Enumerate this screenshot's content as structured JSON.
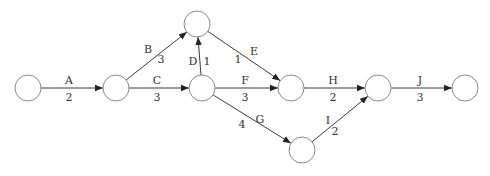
{
  "diagram": {
    "type": "activity-on-arrow network",
    "nodes": [
      {
        "id": "n1",
        "cx": 28,
        "cy": 88,
        "r": 13
      },
      {
        "id": "n2",
        "cx": 116,
        "cy": 88,
        "r": 13
      },
      {
        "id": "n3",
        "cx": 197,
        "cy": 24,
        "r": 13
      },
      {
        "id": "n4",
        "cx": 202,
        "cy": 88,
        "r": 13
      },
      {
        "id": "n5",
        "cx": 291,
        "cy": 88,
        "r": 13
      },
      {
        "id": "n6",
        "cx": 302,
        "cy": 150,
        "r": 13
      },
      {
        "id": "n7",
        "cx": 378,
        "cy": 88,
        "r": 13
      },
      {
        "id": "n8",
        "cx": 465,
        "cy": 88,
        "r": 13
      }
    ],
    "edges": [
      {
        "name": "A",
        "duration": "2",
        "from": "n1",
        "to": "n2",
        "name_pos": [
          69,
          84
        ],
        "dur_pos": [
          69,
          101
        ]
      },
      {
        "name": "B",
        "duration": "3",
        "from": "n2",
        "to": "n3",
        "name_pos": [
          148,
          53
        ],
        "dur_pos": [
          161,
          63
        ]
      },
      {
        "name": "C",
        "duration": "3",
        "from": "n2",
        "to": "n4",
        "name_pos": [
          157,
          84
        ],
        "dur_pos": [
          157,
          101
        ]
      },
      {
        "name": "D",
        "duration": "1",
        "from": "n4",
        "to": "n3",
        "name_pos": [
          193,
          65
        ],
        "dur_pos": [
          207,
          65
        ]
      },
      {
        "name": "E",
        "duration": "1",
        "from": "n3",
        "to": "n5",
        "name_pos": [
          254,
          55
        ],
        "dur_pos": [
          238,
          63
        ]
      },
      {
        "name": "F",
        "duration": "3",
        "from": "n4",
        "to": "n5",
        "name_pos": [
          245,
          84
        ],
        "dur_pos": [
          245,
          101
        ]
      },
      {
        "name": "G",
        "duration": "4",
        "from": "n4",
        "to": "n6",
        "name_pos": [
          260,
          123
        ],
        "dur_pos": [
          242,
          128
        ]
      },
      {
        "name": "H",
        "duration": "2",
        "from": "n5",
        "to": "n7",
        "name_pos": [
          333,
          84
        ],
        "dur_pos": [
          333,
          101
        ]
      },
      {
        "name": "I",
        "duration": "2",
        "from": "n6",
        "to": "n7",
        "name_pos": [
          328,
          124
        ],
        "dur_pos": [
          335,
          135
        ]
      },
      {
        "name": "J",
        "duration": "3",
        "from": "n7",
        "to": "n8",
        "name_pos": [
          420,
          84
        ],
        "dur_pos": [
          420,
          101
        ]
      }
    ]
  }
}
